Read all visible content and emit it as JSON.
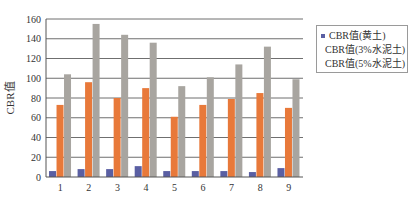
{
  "chart_data": {
    "type": "bar",
    "title": "",
    "xlabel": "",
    "ylabel": "CBR值",
    "ylim": [
      0,
      160
    ],
    "yticks": [
      0,
      20,
      40,
      60,
      80,
      100,
      120,
      140,
      160
    ],
    "grid": true,
    "legend_position": "right",
    "categories": [
      "1",
      "2",
      "3",
      "4",
      "5",
      "6",
      "7",
      "8",
      "9"
    ],
    "series": [
      {
        "name": "CBR值(黄土)",
        "color": "#5a5fa3",
        "values": [
          6,
          8,
          8,
          11,
          6,
          6,
          6,
          5,
          9
        ]
      },
      {
        "name": "CBR值(3%水泥土)",
        "color": "#e8793a",
        "values": [
          73,
          96,
          80,
          90,
          61,
          73,
          79,
          85,
          70
        ]
      },
      {
        "name": "CBR值(5%水泥土)",
        "color": "#a8a5a0",
        "values": [
          104,
          155,
          144,
          136,
          92,
          101,
          114,
          132,
          99
        ]
      }
    ]
  }
}
